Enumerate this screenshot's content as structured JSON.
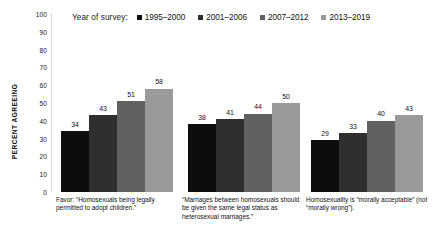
{
  "chart_data": {
    "type": "bar",
    "title": "",
    "subtitle": "",
    "xlabel": "",
    "ylabel": "PERCENT AGREEING",
    "ylim": [
      0,
      100
    ],
    "yticks": [
      100,
      90,
      80,
      70,
      60,
      50,
      40,
      30,
      20,
      10,
      0
    ],
    "grid": false,
    "legend_position": "top",
    "legend_title": "Year of survey:",
    "categories": [
      "Favor: “Homosexuals being legally permitted to adopt children.”",
      "“Marriages between homosexuals should be given the same legal status as heterosexual marriages.”",
      "Homosexuality is “morally acceptable” (not “morally wrong”)."
    ],
    "series": [
      {
        "name": "1995–2000",
        "color": "#0d0d0d",
        "values": [
          34,
          38,
          29
        ]
      },
      {
        "name": "2001–2006",
        "color": "#2f2f2f",
        "values": [
          43,
          41,
          33
        ]
      },
      {
        "name": "2007–2012",
        "color": "#616161",
        "values": [
          51,
          44,
          40
        ]
      },
      {
        "name": "2013–2019",
        "color": "#9a9a9a",
        "values": [
          58,
          50,
          43
        ]
      }
    ]
  },
  "legend": {
    "title": "Year of survey:",
    "items": [
      {
        "label": "1995–2000",
        "color": "#0d0d0d"
      },
      {
        "label": "2001–2006",
        "color": "#2f2f2f"
      },
      {
        "label": "2007–2012",
        "color": "#616161"
      },
      {
        "label": "2013–2019",
        "color": "#9a9a9a"
      }
    ]
  },
  "yaxis": {
    "label": "PERCENT AGREEING",
    "ticks": [
      "100",
      "90",
      "80",
      "70",
      "60",
      "50",
      "40",
      "30",
      "20",
      "10",
      "0"
    ]
  },
  "groups": [
    {
      "caption": "Favor: “Homosexuals being legally permitted to adopt children.”",
      "bars": [
        {
          "series": "1995–2000",
          "value": 34,
          "label": "34",
          "color": "#0d0d0d"
        },
        {
          "series": "2001–2006",
          "value": 43,
          "label": "43",
          "color": "#2f2f2f"
        },
        {
          "series": "2007–2012",
          "value": 51,
          "label": "51",
          "color": "#616161"
        },
        {
          "series": "2013–2019",
          "value": 58,
          "label": "58",
          "color": "#9a9a9a"
        }
      ]
    },
    {
      "caption": "“Marriages between homosexuals should be given the same legal status as heterosexual marriages.”",
      "bars": [
        {
          "series": "1995–2000",
          "value": 38,
          "label": "38",
          "color": "#0d0d0d"
        },
        {
          "series": "2001–2006",
          "value": 41,
          "label": "41",
          "color": "#2f2f2f"
        },
        {
          "series": "2007–2012",
          "value": 44,
          "label": "44",
          "color": "#616161"
        },
        {
          "series": "2013–2019",
          "value": 50,
          "label": "50",
          "color": "#9a9a9a"
        }
      ]
    },
    {
      "caption": "Homosexuality is “morally acceptable” (not “morally wrong”).",
      "bars": [
        {
          "series": "1995–2000",
          "value": 29,
          "label": "29",
          "color": "#0d0d0d"
        },
        {
          "series": "2001–2006",
          "value": 33,
          "label": "33",
          "color": "#2f2f2f"
        },
        {
          "series": "2007–2012",
          "value": 40,
          "label": "40",
          "color": "#616161"
        },
        {
          "series": "2013–2019",
          "value": 43,
          "label": "43",
          "color": "#9a9a9a"
        }
      ]
    }
  ]
}
